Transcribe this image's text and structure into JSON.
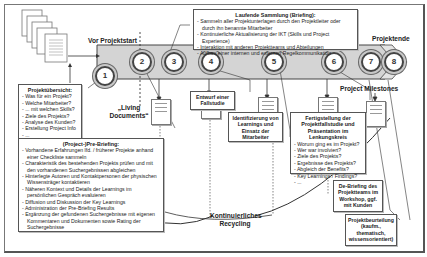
{
  "labels": {
    "pre_start": "Vor Projektstart",
    "end": "Projektende",
    "milestones": "Project Milestones",
    "living_documents": "„Living Documents“",
    "recycling": "Kontinuierliches Recycling"
  },
  "milestones": [
    "1",
    "2",
    "3",
    "4",
    "5",
    "6",
    "7",
    "8"
  ],
  "boxes": {
    "ongoing": {
      "title": "Laufende Sammlung (Briefing):",
      "items": [
        "Sammeln aller Projektunterlagen durch den Projektleiter oder durch ihn benannte Mitarbeiter",
        "Kontinuierliche Aktualisierung der IKT (Skills und Project Experience)",
        "Interaktion mit anderen Projektteams und Abteilungen",
        "Aufbau einer internen und externen Regelkommunikation"
      ]
    },
    "overview": {
      "title": "Projektübersicht:",
      "items": [
        "Was für ein Projekt?",
        "Welche Mitarbeiter?",
        "... mit welchen Skills?",
        "Ziele des Projekts?",
        "Analyse des Kunden?",
        "Erstellung Project Info",
        "..."
      ]
    },
    "prebriefing": {
      "title": "(Project-)Pre-Briefing:",
      "items": [
        "Vorhandene Erfahrungen lfd. / früherer Projekte anhand einer Checkliste sammeln",
        "Charakteristik des bestehenden Projekts prüfen und mit den vorhandenen Suchergebnissen abgleichen",
        "Hinterlegte Autoren und Kontaktpersonen der physischen Wissensträger kontaktieren",
        "Näheren Kontext und Details der Learnings im persönlichen Gespräch evaluieren",
        "Diffusion und Diskussion der Key Learnings",
        "Administration der Pre-Briefing Results",
        "Ergänzung der gefundenen Suchergebnisse mit eigenen Kommentaren und Dokumenten sowie Rating der Suchergebnisse"
      ]
    },
    "case_draft": {
      "title": "Entwurf einer Fallstudie"
    },
    "learnings": {
      "title": "Identifizierung von Learnings und Einsatz der Mitarbeiter"
    },
    "completion": {
      "title": "Fertigstellung der Projektfallstudie und Präsentation im Lenkungskreis",
      "items": [
        "Worum ging es im Projekt?",
        "Wer war involviert?",
        "Ziele des Projekts?",
        "Ergebnisse des Projekts?",
        "Abgleich der Benefits?",
        "Key Learnings / Findings?",
        "..."
      ]
    },
    "debriefing": {
      "title": "De-Briefing des Projektteams im Workshop, ggf. mit Kunden"
    },
    "assessment": {
      "title": "Projektbeurteilung (kaufm., thematisch, wissensorientiert)"
    }
  },
  "colors": {
    "band": "#d4d4d4",
    "border": "#555555",
    "line": "#333333"
  }
}
